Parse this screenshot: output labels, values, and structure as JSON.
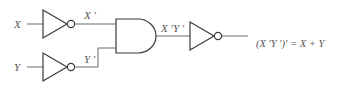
{
  "diagram": {
    "type": "logic-circuit",
    "inputs": [
      {
        "name": "X",
        "label": "X"
      },
      {
        "name": "Y",
        "label": "Y"
      }
    ],
    "gates": [
      {
        "id": "not1",
        "type": "NOT",
        "input": "X",
        "output_label": "X ′"
      },
      {
        "id": "not2",
        "type": "NOT",
        "input": "Y",
        "output_label": "Y ′"
      },
      {
        "id": "and1",
        "type": "AND",
        "inputs": [
          "X ′",
          "Y ′"
        ],
        "output_label": "X ′Y ′"
      },
      {
        "id": "not3",
        "type": "NOT",
        "input": "X ′Y ′"
      }
    ],
    "output_expression": "(X ′Y ′)′ = X + Y"
  }
}
